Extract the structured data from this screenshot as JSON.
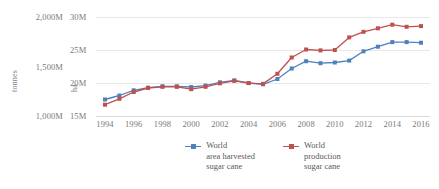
{
  "chart_data": {
    "type": "line",
    "title": "",
    "xlabel": "",
    "x": [
      1994,
      1995,
      1996,
      1997,
      1998,
      1999,
      2000,
      2001,
      2002,
      2003,
      2004,
      2005,
      2006,
      2007,
      2008,
      2009,
      2010,
      2011,
      2012,
      2013,
      2014,
      2015,
      2016
    ],
    "xticklabels": [
      "1994",
      "1996",
      "1998",
      "2000",
      "2002",
      "2004",
      "2006",
      "2008",
      "2010",
      "2012",
      "2014",
      "2016"
    ],
    "xtickvalues": [
      1994,
      1996,
      1998,
      2000,
      2002,
      2004,
      2006,
      2008,
      2010,
      2012,
      2014,
      2016
    ],
    "grid": true,
    "legend_position": "bottom",
    "axes": [
      {
        "id": "left",
        "name": "tonnes",
        "ylabel": "tonnes",
        "ticklabels": [
          "2,000M",
          "1,500M",
          "1,000M"
        ],
        "tickvalues": [
          2000,
          1500,
          1000
        ],
        "ylim": [
          1000,
          2000
        ],
        "unit": "M tonnes"
      },
      {
        "id": "inner",
        "name": "ha",
        "ylabel": "ha",
        "ticklabels": [
          "30M",
          "25M",
          "20M",
          "15M"
        ],
        "tickvalues": [
          30,
          25,
          20,
          15
        ],
        "ylim": [
          15,
          30
        ],
        "unit": "M ha"
      }
    ],
    "series": [
      {
        "name": "World\narea harvested\nsugar cane",
        "legend_label": "World area harvested sugar cane",
        "axis": "inner",
        "color": "#4f81bd",
        "marker": "square",
        "values": [
          17.5,
          18.1,
          18.9,
          19.3,
          19.5,
          19.5,
          19.4,
          19.6,
          20.1,
          20.4,
          20.0,
          19.8,
          20.6,
          22.2,
          23.3,
          23.0,
          23.1,
          23.4,
          24.8,
          25.5,
          26.2,
          26.2,
          26.1
        ]
      },
      {
        "name": "World\nproduction\nsugar cane",
        "legend_label": "World production sugar cane",
        "axis": "left",
        "color": "#c0504d",
        "marker": "square",
        "values": [
          1114,
          1174,
          1242,
          1283,
          1295,
          1295,
          1271,
          1295,
          1330,
          1356,
          1332,
          1324,
          1426,
          1591,
          1672,
          1663,
          1667,
          1794,
          1850,
          1886,
          1922,
          1901,
          1908
        ]
      }
    ]
  },
  "legend": {
    "items": [
      {
        "label": "World\narea harvested\nsugar cane",
        "color": "#4f81bd"
      },
      {
        "label": "World\nproduction\nsugar cane",
        "color": "#c0504d"
      }
    ]
  },
  "colors": {
    "series_blue": "#4f81bd",
    "series_red": "#c0504d",
    "gridline": "#e8e8e8",
    "tick_text": "#7a7a7a",
    "axis_title": "#808080",
    "background": "#ffffff"
  }
}
